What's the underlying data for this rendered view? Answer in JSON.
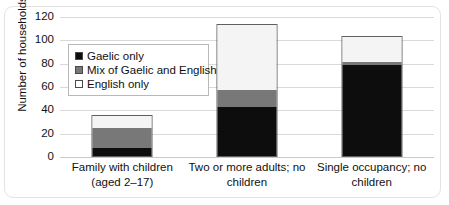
{
  "chart_data": {
    "type": "bar",
    "title": "",
    "subtitle": "",
    "xlabel": "",
    "ylabel": "Number of households",
    "ylim": [
      0,
      120
    ],
    "ytick_labels": [
      "0",
      "20",
      "40",
      "60",
      "80",
      "100",
      "120"
    ],
    "ytick_values": [
      0,
      20,
      40,
      60,
      80,
      100,
      120
    ],
    "grid": true,
    "stacked": true,
    "legend_position": "inside-upper-left",
    "categories": [
      "Family with children (aged 2–17)",
      "Two or more adults; no children",
      "Single occupancy; no children"
    ],
    "series": [
      {
        "name": "Gaelic only",
        "color": "#0d0d0d",
        "values": [
          7,
          42,
          78
        ]
      },
      {
        "name": "Mix of Gaelic and English",
        "color": "#787878",
        "values": [
          17,
          15,
          3
        ]
      },
      {
        "name": "English only",
        "color": "#ffffff",
        "values": [
          10,
          55,
          21
        ]
      }
    ],
    "totals": [
      34,
      112,
      102
    ]
  },
  "legend": {
    "items": [
      {
        "label": "Gaelic only",
        "swatch": "black-square-swatch"
      },
      {
        "label": "Mix of Gaelic and English",
        "swatch": "gray-square-swatch"
      },
      {
        "label": "English only",
        "swatch": "white-square-swatch"
      }
    ]
  },
  "axes": {
    "y_title": "Number of households",
    "y_ticks": [
      "120",
      "100",
      "80",
      "60",
      "40",
      "20",
      "0"
    ],
    "x_labels": [
      "Family with children (aged 2–17)",
      "Two or more adults; no children",
      "Single occupancy; no children"
    ]
  },
  "colors": {
    "gaelic_only": "#0d0d0d",
    "mix_gaelic_english": "#787878",
    "english_only": "#f4f4f4",
    "gridline": "#d9d9d9",
    "bar_outline": "#5f5f5f",
    "frame": "#e3e3e3",
    "text": "#111111"
  }
}
